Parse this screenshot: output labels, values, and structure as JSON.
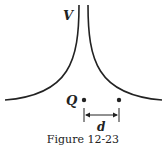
{
  "figure": {
    "caption": "Figure 12-23",
    "potential_label": "V",
    "charge_label": "Q",
    "distance_label": "d"
  },
  "colors": {
    "line": "#222222",
    "background": "#ffffff"
  }
}
